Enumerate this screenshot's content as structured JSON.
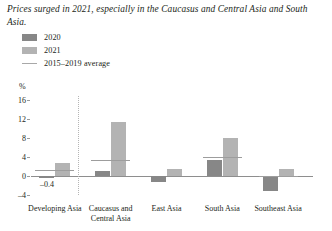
{
  "title": "Prices surged in 2021, especially in the Caucasus and Central Asia and South Asia.",
  "legend": [
    {
      "label": "2020",
      "icon": "square-swatch",
      "color": "#878787"
    },
    {
      "label": "2021",
      "icon": "square-swatch",
      "color": "#b3b3b3"
    },
    {
      "label": "2015–2019 average",
      "icon": "line-swatch",
      "color": "#a8a8a8"
    }
  ],
  "chart_data": {
    "type": "bar",
    "title": "Prices surged in 2021, especially in the Caucasus and Central Asia and South Asia.",
    "xlabel": "",
    "ylabel": "%",
    "ylim": [
      -4,
      16
    ],
    "yticks": [
      -4,
      0,
      4,
      8,
      12,
      16
    ],
    "ytick_labels": [
      "–4",
      "0",
      "4",
      "8",
      "12",
      "16"
    ],
    "unit": "%",
    "grid": false,
    "legend_position": "top-left",
    "categories": [
      "Developing Asia",
      "Caucasus and Central Asia",
      "East Asia",
      "South Asia",
      "Southeast Asia"
    ],
    "series": [
      {
        "name": "2020",
        "color": "#878787",
        "values": [
          -0.4,
          1.1,
          -1.2,
          3.4,
          -3.1
        ]
      },
      {
        "name": "2021",
        "color": "#b3b3b3",
        "values": [
          2.7,
          11.3,
          1.5,
          7.9,
          1.4
        ]
      },
      {
        "name": "2015–2019 average",
        "type": "line-marker",
        "color": "#9d9d9d",
        "values": [
          1.2,
          3.4,
          null,
          3.9,
          0.0
        ]
      }
    ],
    "annotations": [
      {
        "text": "–0.4",
        "category": "Developing Asia",
        "series": "2020",
        "value": -0.4
      }
    ]
  }
}
